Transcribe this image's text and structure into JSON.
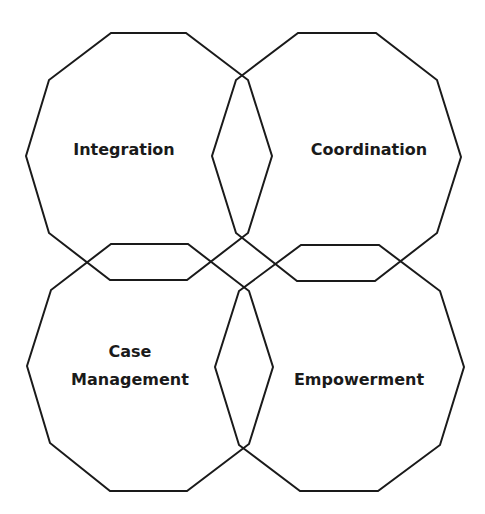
{
  "diagram": {
    "type": "four overlapping decagons",
    "stroke_color": "#1a1a1a",
    "background": "#ffffff",
    "shapes": [
      {
        "id": "integration",
        "label_lines": [
          "Integration"
        ],
        "points": "111,33 186,33 248,80 272,156 248,233 187,280 110,280 49,233 26,156 49,80",
        "label_x": 124,
        "label_y": 150
      },
      {
        "id": "coordination",
        "label_lines": [
          "Coordination"
        ],
        "points": "298,33 376,33 437,80 461,157 437,233 375,281 297,281 236,233 212,156 236,80",
        "label_x": 369,
        "label_y": 150
      },
      {
        "id": "case-management",
        "label_lines": [
          "Case",
          "Management"
        ],
        "points": "111,244 188,244 249,291 273,367 249,444 187,491 110,491 50,443 27,366 51,290",
        "label_x": 130,
        "label_y": 352,
        "label_y2": 380
      },
      {
        "id": "empowerment",
        "label_lines": [
          "Empowerment"
        ],
        "points": "301,245 379,245 440,291 464,367 440,445 378,491 300,491 239,445 215,367 239,291",
        "label_x": 359,
        "label_y": 380
      }
    ]
  }
}
